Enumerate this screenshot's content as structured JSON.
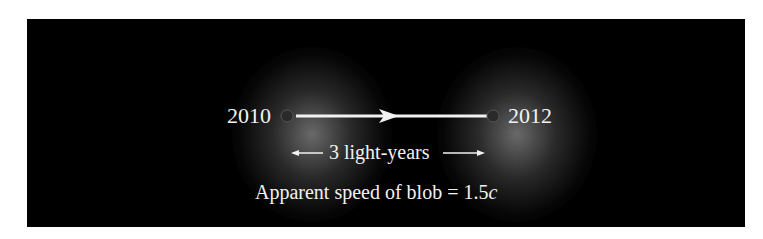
{
  "diagram": {
    "start_label": "2010",
    "end_label": "2012",
    "distance_label": "3 light-years",
    "speed_label_prefix": "Apparent speed of blob = 1.5",
    "speed_label_unit": "c",
    "colors": {
      "background": "#000000",
      "text": "#f2f2f2",
      "line": "#f2f2f2",
      "marker_fill": "#2a2a2a",
      "marker_stroke": "#555555"
    }
  }
}
